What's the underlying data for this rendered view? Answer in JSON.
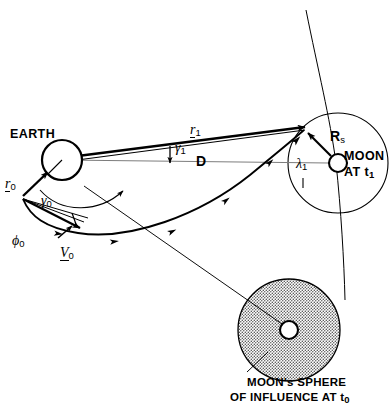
{
  "figure": {
    "type": "orbital-mechanics-diagram",
    "title_visible": false,
    "background": "#ffffff",
    "ink": "#000000"
  },
  "bodies": {
    "earth": {
      "label": "EARTH",
      "cx": 62,
      "cy": 160,
      "r": 20,
      "filled": false
    },
    "moon_t1": {
      "label_line1": "MOON",
      "label_line2": "AT t",
      "label_sub2": "1",
      "cx": 338,
      "cy": 163,
      "r": 9,
      "soi_r": 50,
      "soi_shaded": false
    },
    "moon_soi_t0": {
      "caption_line1": "MOON's SPHERE",
      "caption_line2": "OF INFLUENCE AT t",
      "caption_sub2": "0",
      "cx": 289,
      "cy": 330,
      "r": 51,
      "moon_r": 9,
      "soi_shaded": true,
      "shade_color": "#c9c9c9"
    }
  },
  "vectors": {
    "r0": {
      "symbol": "r",
      "subscript": "0",
      "underlined": true
    },
    "r1": {
      "symbol": "r",
      "subscript": "1",
      "underlined": true
    },
    "v0": {
      "symbol": "V",
      "subscript": "0",
      "underlined": true
    },
    "Rs": {
      "symbol": "R",
      "subscript": "s",
      "underlined": false
    },
    "D": {
      "symbol": "D",
      "subscript": "",
      "underlined": false
    }
  },
  "angles": {
    "gamma0": {
      "symbol": "γ",
      "subscript": "0"
    },
    "gamma1": {
      "symbol": "γ",
      "subscript": "1"
    },
    "lambda1": {
      "symbol": "λ",
      "subscript": "1"
    },
    "phi0": {
      "symbol": "ϕ",
      "subscript": "0"
    }
  },
  "curves": {
    "transfer_trajectory": "thick arc from launch point past Earth-Moon line into moon SOI at t1",
    "moon_orbit_arc": "thin arc passing through moon at t1 from top of frame",
    "soi_sight_line": "thin straight line from Earth to lower SOI"
  }
}
